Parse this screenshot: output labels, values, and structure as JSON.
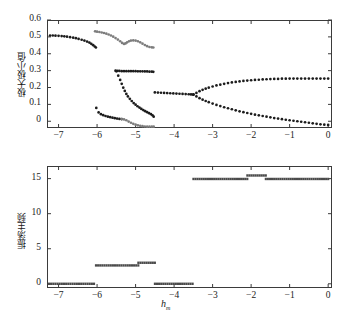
{
  "figure": {
    "background_color": "#ffffff",
    "axis_color": "#3b3b3b",
    "marker_color_dark": "#1c1c1c",
    "marker_color_gray": "#7d7d7d"
  },
  "chart_data": [
    {
      "type": "scatter",
      "panel": "top",
      "title": "",
      "xlabel": "h",
      "xlabel_sub": "m",
      "ylabel": "极大极小值",
      "xlim": [
        -7.3,
        0.1
      ],
      "ylim": [
        -0.04,
        0.6
      ],
      "xticks": [
        -7,
        -6,
        -5,
        -4,
        -3,
        -2,
        -1,
        0
      ],
      "xtick_labels": [
        "−7",
        "−6",
        "−5",
        "−4",
        "−3",
        "−2",
        "−1",
        "0"
      ],
      "yticks": [
        0,
        0.1,
        0.2,
        0.3,
        0.4,
        0.5,
        0.6
      ],
      "ytick_labels": [
        "0",
        "0.1",
        "0.2",
        "0.3",
        "0.4",
        "0.5",
        "0.6"
      ],
      "grid": false,
      "legend": "none",
      "series": [
        {
          "name": "branch-upper-left-dark",
          "color": "#1c1c1c",
          "points": [
            [
              -7.22,
              0.508
            ],
            [
              -7.15,
              0.508
            ],
            [
              -7.08,
              0.507
            ],
            [
              -7.0,
              0.506
            ],
            [
              -6.92,
              0.505
            ],
            [
              -6.85,
              0.503
            ],
            [
              -6.78,
              0.501
            ],
            [
              -6.7,
              0.498
            ],
            [
              -6.62,
              0.495
            ],
            [
              -6.55,
              0.492
            ],
            [
              -6.48,
              0.488
            ],
            [
              -6.4,
              0.483
            ],
            [
              -6.33,
              0.478
            ],
            [
              -6.26,
              0.472
            ],
            [
              -6.2,
              0.466
            ],
            [
              -6.15,
              0.459
            ],
            [
              -6.1,
              0.451
            ],
            [
              -6.06,
              0.443
            ],
            [
              -6.03,
              0.437
            ]
          ]
        },
        {
          "name": "branch-lower-left-dark",
          "color": "#1c1c1c",
          "points": [
            [
              -6.02,
              0.079
            ],
            [
              -5.96,
              0.052
            ],
            [
              -5.9,
              0.042
            ],
            [
              -5.84,
              0.036
            ],
            [
              -5.78,
              0.031
            ],
            [
              -5.72,
              0.027
            ],
            [
              -5.66,
              0.024
            ],
            [
              -5.6,
              0.021
            ],
            [
              -5.54,
              0.018
            ],
            [
              -5.48,
              0.016
            ],
            [
              -5.42,
              0.014
            ],
            [
              -5.36,
              0.013
            ]
          ]
        },
        {
          "name": "branch-upper-mid-gray",
          "color": "#7d7d7d",
          "points": [
            [
              -6.05,
              0.533
            ],
            [
              -6.0,
              0.531
            ],
            [
              -5.94,
              0.529
            ],
            [
              -5.88,
              0.526
            ],
            [
              -5.82,
              0.523
            ],
            [
              -5.76,
              0.519
            ],
            [
              -5.7,
              0.514
            ],
            [
              -5.64,
              0.508
            ],
            [
              -5.58,
              0.501
            ],
            [
              -5.52,
              0.493
            ],
            [
              -5.46,
              0.484
            ],
            [
              -5.4,
              0.474
            ],
            [
              -5.35,
              0.464
            ],
            [
              -5.3,
              0.458
            ],
            [
              -5.26,
              0.461
            ],
            [
              -5.22,
              0.468
            ],
            [
              -5.17,
              0.474
            ],
            [
              -5.12,
              0.478
            ],
            [
              -5.06,
              0.479
            ],
            [
              -5.0,
              0.478
            ],
            [
              -4.94,
              0.474
            ],
            [
              -4.88,
              0.468
            ],
            [
              -4.82,
              0.46
            ],
            [
              -4.76,
              0.452
            ],
            [
              -4.7,
              0.445
            ],
            [
              -4.64,
              0.44
            ],
            [
              -4.58,
              0.438
            ],
            [
              -4.54,
              0.437
            ]
          ]
        },
        {
          "name": "branch-mid-dark-plateau",
          "color": "#1c1c1c",
          "points": [
            [
              -5.52,
              0.3
            ],
            [
              -5.47,
              0.299
            ],
            [
              -5.42,
              0.298
            ],
            [
              -5.36,
              0.297
            ],
            [
              -5.3,
              0.297
            ],
            [
              -5.24,
              0.297
            ],
            [
              -5.18,
              0.297
            ],
            [
              -5.12,
              0.297
            ],
            [
              -5.06,
              0.297
            ],
            [
              -5.0,
              0.297
            ],
            [
              -4.94,
              0.296
            ],
            [
              -4.88,
              0.296
            ],
            [
              -4.82,
              0.296
            ],
            [
              -4.76,
              0.295
            ],
            [
              -4.7,
              0.295
            ],
            [
              -4.64,
              0.294
            ],
            [
              -4.58,
              0.294
            ],
            [
              -4.54,
              0.293
            ]
          ]
        },
        {
          "name": "branch-descending-dark",
          "color": "#1c1c1c",
          "points": [
            [
              -5.5,
              0.296
            ],
            [
              -5.45,
              0.27
            ],
            [
              -5.4,
              0.245
            ],
            [
              -5.36,
              0.222
            ],
            [
              -5.32,
              0.199
            ],
            [
              -5.28,
              0.18
            ],
            [
              -5.24,
              0.162
            ],
            [
              -5.2,
              0.147
            ],
            [
              -5.15,
              0.133
            ],
            [
              -5.1,
              0.12
            ],
            [
              -5.05,
              0.108
            ],
            [
              -5.0,
              0.098
            ],
            [
              -4.95,
              0.089
            ],
            [
              -4.9,
              0.081
            ],
            [
              -4.85,
              0.073
            ],
            [
              -4.8,
              0.066
            ],
            [
              -4.75,
              0.06
            ],
            [
              -4.7,
              0.054
            ],
            [
              -4.65,
              0.048
            ],
            [
              -4.6,
              0.042
            ],
            [
              -4.56,
              0.035
            ],
            [
              -4.53,
              0.027
            ]
          ]
        },
        {
          "name": "branch-bottom-gray",
          "color": "#7d7d7d",
          "points": [
            [
              -5.36,
              0.013
            ],
            [
              -5.3,
              0.011
            ],
            [
              -5.24,
              0.006
            ],
            [
              -5.18,
              -0.002
            ],
            [
              -5.12,
              -0.009
            ],
            [
              -5.06,
              -0.015
            ],
            [
              -5.0,
              -0.02
            ],
            [
              -4.94,
              -0.024
            ],
            [
              -4.88,
              -0.027
            ],
            [
              -4.82,
              -0.029
            ],
            [
              -4.76,
              -0.031
            ],
            [
              -4.7,
              -0.032
            ],
            [
              -4.64,
              -0.032
            ],
            [
              -4.58,
              -0.032
            ],
            [
              -4.53,
              -0.032
            ]
          ]
        },
        {
          "name": "branch-right-single",
          "color": "#1c1c1c",
          "points": [
            [
              -4.5,
              0.171
            ],
            [
              -4.42,
              0.17
            ],
            [
              -4.34,
              0.169
            ],
            [
              -4.26,
              0.168
            ],
            [
              -4.18,
              0.167
            ],
            [
              -4.1,
              0.166
            ],
            [
              -4.02,
              0.165
            ],
            [
              -3.94,
              0.164
            ],
            [
              -3.86,
              0.163
            ],
            [
              -3.78,
              0.162
            ],
            [
              -3.7,
              0.161
            ],
            [
              -3.62,
              0.16
            ],
            [
              -3.56,
              0.159
            ],
            [
              -3.5,
              0.158
            ]
          ]
        },
        {
          "name": "branch-right-upper",
          "color": "#1c1c1c",
          "points": [
            [
              -3.5,
              0.158
            ],
            [
              -3.42,
              0.168
            ],
            [
              -3.34,
              0.178
            ],
            [
              -3.26,
              0.186
            ],
            [
              -3.18,
              0.193
            ],
            [
              -3.1,
              0.199
            ],
            [
              -3.0,
              0.206
            ],
            [
              -2.9,
              0.212
            ],
            [
              -2.8,
              0.217
            ],
            [
              -2.7,
              0.222
            ],
            [
              -2.6,
              0.226
            ],
            [
              -2.5,
              0.23
            ],
            [
              -2.4,
              0.233
            ],
            [
              -2.3,
              0.236
            ],
            [
              -2.2,
              0.239
            ],
            [
              -2.1,
              0.241
            ],
            [
              -2.0,
              0.243
            ],
            [
              -1.9,
              0.245
            ],
            [
              -1.8,
              0.246
            ],
            [
              -1.7,
              0.248
            ],
            [
              -1.6,
              0.249
            ],
            [
              -1.5,
              0.25
            ],
            [
              -1.4,
              0.251
            ],
            [
              -1.3,
              0.251
            ],
            [
              -1.2,
              0.252
            ],
            [
              -1.1,
              0.252
            ],
            [
              -1.0,
              0.253
            ],
            [
              -0.9,
              0.253
            ],
            [
              -0.8,
              0.253
            ],
            [
              -0.7,
              0.253
            ],
            [
              -0.6,
              0.253
            ],
            [
              -0.5,
              0.253
            ],
            [
              -0.4,
              0.253
            ],
            [
              -0.3,
              0.253
            ],
            [
              -0.2,
              0.253
            ],
            [
              -0.1,
              0.253
            ],
            [
              0.0,
              0.253
            ]
          ]
        },
        {
          "name": "branch-right-lower",
          "color": "#1c1c1c",
          "points": [
            [
              -3.5,
              0.158
            ],
            [
              -3.42,
              0.147
            ],
            [
              -3.34,
              0.137
            ],
            [
              -3.26,
              0.128
            ],
            [
              -3.18,
              0.12
            ],
            [
              -3.1,
              0.113
            ],
            [
              -3.0,
              0.105
            ],
            [
              -2.9,
              0.097
            ],
            [
              -2.8,
              0.09
            ],
            [
              -2.7,
              0.083
            ],
            [
              -2.6,
              0.077
            ],
            [
              -2.5,
              0.071
            ],
            [
              -2.4,
              0.065
            ],
            [
              -2.3,
              0.059
            ],
            [
              -2.2,
              0.054
            ],
            [
              -2.1,
              0.049
            ],
            [
              -2.0,
              0.044
            ],
            [
              -1.9,
              0.039
            ],
            [
              -1.8,
              0.035
            ],
            [
              -1.7,
              0.031
            ],
            [
              -1.6,
              0.027
            ],
            [
              -1.5,
              0.023
            ],
            [
              -1.4,
              0.019
            ],
            [
              -1.3,
              0.016
            ],
            [
              -1.2,
              0.012
            ],
            [
              -1.1,
              0.009
            ],
            [
              -1.0,
              0.006
            ],
            [
              -0.9,
              0.003
            ],
            [
              -0.8,
              0.0
            ],
            [
              -0.7,
              -0.003
            ],
            [
              -0.6,
              -0.006
            ],
            [
              -0.5,
              -0.009
            ],
            [
              -0.4,
              -0.012
            ],
            [
              -0.3,
              -0.015
            ],
            [
              -0.2,
              -0.018
            ],
            [
              -0.1,
              -0.02
            ],
            [
              0.0,
              -0.022
            ]
          ]
        }
      ]
    },
    {
      "type": "scatter",
      "panel": "bottom",
      "title": "",
      "xlabel": "h",
      "xlabel_sub": "m",
      "ylabel": "振荡主频",
      "xlim": [
        -7.3,
        0.1
      ],
      "ylim": [
        -0.6,
        16.8
      ],
      "xticks": [
        -7,
        -6,
        -5,
        -4,
        -3,
        -2,
        -1,
        0
      ],
      "xtick_labels": [
        "−7",
        "−6",
        "−5",
        "−4",
        "−3",
        "−2",
        "−1",
        "0"
      ],
      "yticks": [
        0,
        5,
        10,
        15
      ],
      "ytick_labels": [
        "0",
        "5",
        "10",
        "15"
      ],
      "grid": false,
      "legend": "none",
      "series": [
        {
          "name": "freq-zero-left",
          "color": "#4a4a4a",
          "segment": [
            -7.25,
            -6.08
          ],
          "value": 0.0
        },
        {
          "name": "freq-step-2p6",
          "color": "#4a4a4a",
          "segment": [
            -6.03,
            -4.93
          ],
          "value": 2.62
        },
        {
          "name": "freq-step-3p0",
          "color": "#4a4a4a",
          "segment": [
            -4.93,
            -4.5
          ],
          "value": 3.0
        },
        {
          "name": "freq-zero-mid",
          "color": "#4a4a4a",
          "segment": [
            -4.5,
            -3.52
          ],
          "value": 0.0
        },
        {
          "name": "freq-step-15a",
          "color": "#4a4a4a",
          "segment": [
            -3.5,
            -2.1
          ],
          "value": 14.95
        },
        {
          "name": "freq-step-15p5",
          "color": "#4a4a4a",
          "segment": [
            -2.1,
            -1.62
          ],
          "value": 15.45
        },
        {
          "name": "freq-step-15b",
          "color": "#4a4a4a",
          "segment": [
            -1.62,
            0.0
          ],
          "value": 14.95
        }
      ]
    }
  ]
}
